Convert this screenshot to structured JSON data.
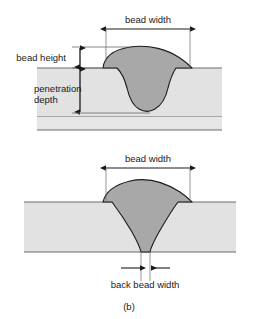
{
  "figure": {
    "caption": "(b)",
    "background_color": "#ffffff",
    "line_color": "#4a4a4a",
    "outline_color": "#1a1a1a",
    "text_color": "#1a1a1a",
    "plate_fill": "#e2e2e2",
    "bead_fill": "#a8a8a8"
  },
  "top_figure": {
    "name": "partial-penetration-weld-cross-section",
    "labels": {
      "bead_width": "bead width",
      "bead_height": "bead height",
      "penetration_depth_line1": "penetration",
      "penetration_depth_line2": "depth"
    }
  },
  "bottom_figure": {
    "name": "full-penetration-weld-cross-section",
    "labels": {
      "bead_width": "bead width",
      "back_bead_width": "back bead width"
    }
  }
}
